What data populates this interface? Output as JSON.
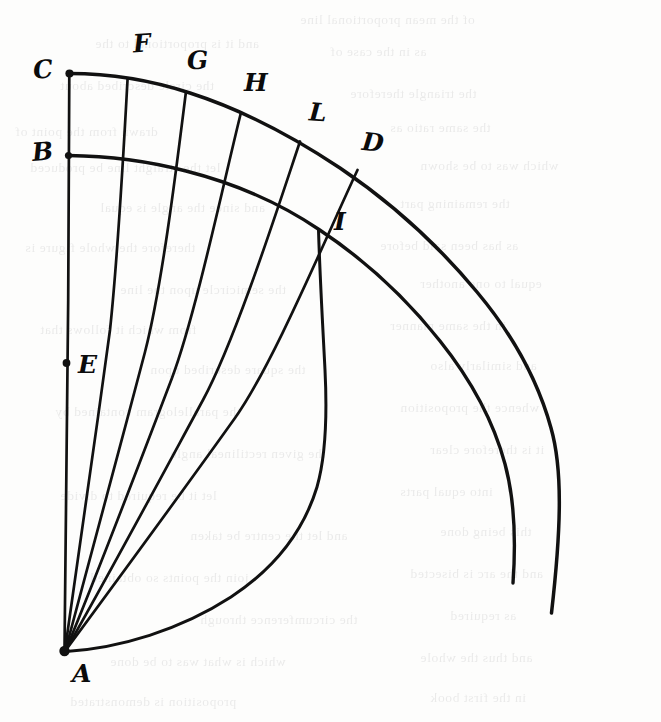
{
  "figure": {
    "kind": "hand-drawn-geometric-diagram",
    "ink_color": "#111111",
    "paper_color": "#fdfdfc",
    "ghost_text_color": "#2a2a30"
  },
  "points": [
    {
      "id": "C",
      "label": "C",
      "x": 69,
      "y": 73,
      "label_x": 33,
      "label_y": 57,
      "dot": true,
      "note": "top of vertical line, start of outer arc"
    },
    {
      "id": "F",
      "label": "F",
      "x": 128,
      "y": 78,
      "label_x": 133,
      "label_y": 31,
      "dot": false,
      "note": "first division on outer arc"
    },
    {
      "id": "G",
      "label": "G",
      "x": 186,
      "y": 91,
      "label_x": 187,
      "label_y": 48,
      "dot": false,
      "note": "second division on outer arc"
    },
    {
      "id": "H",
      "label": "H",
      "x": 241,
      "y": 112,
      "label_x": 244,
      "label_y": 70,
      "dot": false,
      "note": "third division on outer arc"
    },
    {
      "id": "L",
      "label": "L",
      "x": 300,
      "y": 141,
      "label_x": 309,
      "label_y": 100,
      "dot": false,
      "note": "fourth division on outer arc"
    },
    {
      "id": "D",
      "label": "D",
      "x": 357,
      "y": 170,
      "label_x": 362,
      "label_y": 130,
      "dot": false,
      "note": "end of drawn divisions on outer arc"
    },
    {
      "id": "B",
      "label": "B",
      "x": 68,
      "y": 155,
      "label_x": 32,
      "label_y": 139,
      "dot": true,
      "note": "start of inner arc on vertical line"
    },
    {
      "id": "E",
      "label": "E",
      "x": 66,
      "y": 363,
      "label_x": 78,
      "label_y": 352,
      "dot": true,
      "note": "marked point on vertical line AC"
    },
    {
      "id": "I",
      "label": "I",
      "x": 318,
      "y": 230,
      "label_x": 334,
      "label_y": 209,
      "dot": false,
      "note": "intersection of inner arc, radius AD and the arc from A"
    },
    {
      "id": "A",
      "label": "A",
      "x": 64,
      "y": 651,
      "label_x": 72,
      "label_y": 661,
      "dot": true,
      "note": "apex / centre of the radial fan"
    }
  ],
  "labels": [
    "C",
    "F",
    "G",
    "H",
    "L",
    "D",
    "B",
    "E",
    "I",
    "A"
  ],
  "ghost_text": [
    {
      "x": 300,
      "y": 12,
      "text": "of the mean proportional line"
    },
    {
      "x": 95,
      "y": 36,
      "text": "and it is proportional to the"
    },
    {
      "x": 330,
      "y": 44,
      "text": "as in the case of"
    },
    {
      "x": 60,
      "y": 78,
      "text": "the circle described about"
    },
    {
      "x": 350,
      "y": 86,
      "text": "the triangle therefore"
    },
    {
      "x": 15,
      "y": 124,
      "text": "drawn from the point of"
    },
    {
      "x": 390,
      "y": 120,
      "text": "the same ratio as"
    },
    {
      "x": 30,
      "y": 160,
      "text": "let the straight line be produced"
    },
    {
      "x": 420,
      "y": 158,
      "text": "which was to be shown"
    },
    {
      "x": 100,
      "y": 200,
      "text": "and since the angle is equal"
    },
    {
      "x": 400,
      "y": 196,
      "text": "the remaining part"
    },
    {
      "x": 25,
      "y": 240,
      "text": "therefore the whole figure is"
    },
    {
      "x": 380,
      "y": 238,
      "text": "as has been said before"
    },
    {
      "x": 120,
      "y": 282,
      "text": "the semicircle upon the line"
    },
    {
      "x": 420,
      "y": 276,
      "text": "equal to one another"
    },
    {
      "x": 40,
      "y": 322,
      "text": "from which it follows that"
    },
    {
      "x": 390,
      "y": 318,
      "text": "in the same manner"
    },
    {
      "x": 150,
      "y": 362,
      "text": "the square described upon"
    },
    {
      "x": 430,
      "y": 358,
      "text": "and similarly also"
    },
    {
      "x": 55,
      "y": 404,
      "text": "the parallelogram contained by"
    },
    {
      "x": 400,
      "y": 400,
      "text": "whence the proposition"
    },
    {
      "x": 170,
      "y": 446,
      "text": "the given rectilineal angle"
    },
    {
      "x": 430,
      "y": 442,
      "text": "it is therefore clear"
    },
    {
      "x": 60,
      "y": 488,
      "text": "let it be required to divide"
    },
    {
      "x": 400,
      "y": 484,
      "text": "into equal parts"
    },
    {
      "x": 190,
      "y": 528,
      "text": "and let the centre be taken"
    },
    {
      "x": 440,
      "y": 524,
      "text": "this being done"
    },
    {
      "x": 90,
      "y": 570,
      "text": "join the points so obtained"
    },
    {
      "x": 410,
      "y": 566,
      "text": "and the arc is bisected"
    },
    {
      "x": 200,
      "y": 612,
      "text": "the circumference through"
    },
    {
      "x": 450,
      "y": 608,
      "text": "as required"
    },
    {
      "x": 110,
      "y": 654,
      "text": "which is what was to be done"
    },
    {
      "x": 420,
      "y": 650,
      "text": "and thus the whole"
    },
    {
      "x": 70,
      "y": 694,
      "text": "proposition is demonstrated"
    },
    {
      "x": 430,
      "y": 690,
      "text": "in the first book"
    }
  ],
  "curves": {
    "outer_arc": {
      "name": "outer-arc-C-D",
      "from": "C",
      "through": "D",
      "end_x": 551,
      "end_y": 613,
      "note": "large arc centred near A passing through C, F, G, H, L, D and continuing past D"
    },
    "inner_arc": {
      "name": "inner-arc-B-I",
      "from": "B",
      "through": "I",
      "end_x": 513,
      "end_y": 583,
      "note": "concentric inner arc starting at B, passing through I and continuing down right"
    },
    "arc_from_A": {
      "name": "arc-A-I",
      "from": "A",
      "to": "I",
      "note": "arc sweeping from apex A rightwards and up to the intersection point I"
    }
  },
  "radials": [
    {
      "name": "radial-A-C",
      "to": "C",
      "note": "vertical line through E and B up to C"
    },
    {
      "name": "radial-A-F",
      "to": "F"
    },
    {
      "name": "radial-A-G",
      "to": "G"
    },
    {
      "name": "radial-A-H",
      "to": "H"
    },
    {
      "name": "radial-A-L",
      "to": "L"
    },
    {
      "name": "radial-A-D",
      "to": "D",
      "note": "passes through intersection point I"
    }
  ]
}
